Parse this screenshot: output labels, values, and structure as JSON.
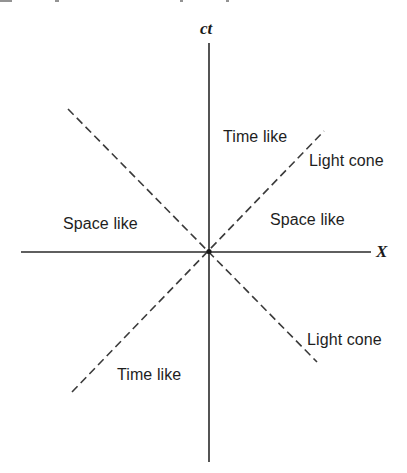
{
  "diagram": {
    "type": "spacetime-diagram",
    "axes": {
      "vertical_label": "ct",
      "horizontal_label": "X"
    },
    "regions": {
      "time_like_upper": "Time like",
      "time_like_lower": "Time like",
      "space_like_left": "Space like",
      "space_like_right": "Space like"
    },
    "light_cone_labels": {
      "upper": "Light cone",
      "lower": "Light cone"
    },
    "colors": {
      "axis": "#2a2a2a",
      "light_cone": "#3a3a3a",
      "text": "#1e1e1e",
      "background": "#ffffff"
    }
  }
}
